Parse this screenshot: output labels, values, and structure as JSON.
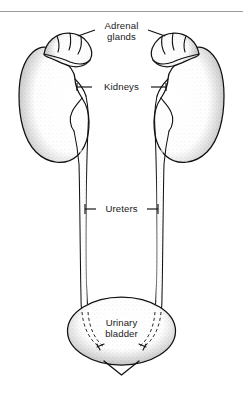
{
  "figure": {
    "name": "urinary-system-diagram",
    "background_color": "#ffffff",
    "ink_color": "#111111",
    "text_color": "#1b1b1b",
    "rule_color": "#9a9a9a"
  },
  "labels": {
    "adrenal": {
      "line1": "Adrenal",
      "line2": "glands"
    },
    "kidneys": "Kidneys",
    "ureters": "Ureters",
    "bladder": {
      "line1": "Urinary",
      "line2": "bladder"
    }
  },
  "structures": [
    {
      "id": "adrenal-gland-left",
      "label": "Adrenal glands"
    },
    {
      "id": "adrenal-gland-right",
      "label": "Adrenal glands"
    },
    {
      "id": "kidney-left",
      "label": "Kidneys"
    },
    {
      "id": "kidney-right",
      "label": "Kidneys"
    },
    {
      "id": "ureter-left",
      "label": "Ureters"
    },
    {
      "id": "ureter-right",
      "label": "Ureters"
    },
    {
      "id": "urinary-bladder",
      "label": "Urinary bladder"
    },
    {
      "id": "urethra",
      "label": ""
    }
  ]
}
